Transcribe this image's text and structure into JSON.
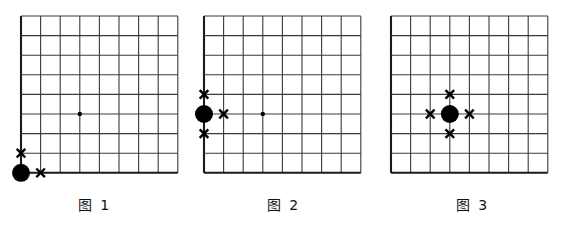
{
  "page": {
    "background_color": "#ffffff",
    "line_color": "#3a3a3a",
    "border_color": "#1a1a1a",
    "mark_color": "#000000",
    "stone_color": "#000000",
    "width": 567,
    "height": 228
  },
  "figures": [
    {
      "id": "figure-1",
      "caption": "图 1",
      "board": {
        "cols": 8,
        "rows": 8,
        "origin_x": 21,
        "origin_y": 16,
        "cell": 19.6,
        "edges": {
          "left": true,
          "bottom": true,
          "top": false,
          "right": false
        }
      },
      "stones": [
        {
          "type": "black",
          "col": 0,
          "row": 8,
          "radius": 9
        }
      ],
      "star_points": [
        {
          "col": 3,
          "row": 5,
          "radius": 2.2
        }
      ],
      "marks": [
        {
          "glyph": "✕",
          "col": 0,
          "row": 7
        },
        {
          "glyph": "✕",
          "col": 1,
          "row": 8
        }
      ],
      "liberties": 2
    },
    {
      "id": "figure-2",
      "caption": "图 2",
      "board": {
        "cols": 8,
        "rows": 8,
        "origin_x": 15,
        "origin_y": 16,
        "cell": 19.6,
        "edges": {
          "left": true,
          "bottom": true,
          "top": false,
          "right": false
        }
      },
      "stones": [
        {
          "type": "black",
          "col": 0,
          "row": 5,
          "radius": 9
        }
      ],
      "star_points": [
        {
          "col": 3,
          "row": 5,
          "radius": 2.2
        }
      ],
      "marks": [
        {
          "glyph": "✕",
          "col": 0,
          "row": 4
        },
        {
          "glyph": "✕",
          "col": 1,
          "row": 5
        },
        {
          "glyph": "✕",
          "col": 0,
          "row": 6
        }
      ],
      "liberties": 3
    },
    {
      "id": "figure-3",
      "caption": "图 3",
      "board": {
        "cols": 8,
        "rows": 8,
        "origin_x": 13,
        "origin_y": 16,
        "cell": 19.6,
        "edges": {
          "left": true,
          "bottom": true,
          "top": false,
          "right": false
        }
      },
      "stones": [
        {
          "type": "black",
          "col": 3,
          "row": 5,
          "radius": 9
        }
      ],
      "star_points": [],
      "marks": [
        {
          "glyph": "✕",
          "col": 3,
          "row": 4
        },
        {
          "glyph": "✕",
          "col": 2,
          "row": 5
        },
        {
          "glyph": "✕",
          "col": 4,
          "row": 5
        },
        {
          "glyph": "✕",
          "col": 3,
          "row": 6
        }
      ],
      "liberties": 4
    }
  ]
}
